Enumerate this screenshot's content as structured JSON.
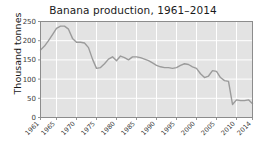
{
  "chart_data": {
    "type": "line",
    "title": "Banana production, 1961–2014",
    "xlabel": "",
    "ylabel": "Thousand tonnes",
    "xlim": [
      1961,
      2014
    ],
    "ylim": [
      0,
      250
    ],
    "grid": true,
    "legend": "none",
    "line_color": "#9b9b9b",
    "plot_bg": "#e3e3e3",
    "grid_color": "#ffffff",
    "xticks": [
      "1961",
      "1965",
      "1970",
      "1975",
      "1980",
      "1985",
      "1990",
      "1995",
      "2000",
      "2005",
      "2010",
      "2014"
    ],
    "xtick_values": [
      1961,
      1965,
      1970,
      1975,
      1980,
      1985,
      1990,
      1995,
      2000,
      2005,
      2010,
      2014
    ],
    "yticks": [
      "0",
      "50",
      "100",
      "150",
      "200",
      "250"
    ],
    "ytick_values": [
      0,
      50,
      100,
      150,
      200,
      250
    ],
    "x": [
      1961,
      1962,
      1963,
      1964,
      1965,
      1966,
      1967,
      1968,
      1969,
      1970,
      1971,
      1972,
      1973,
      1974,
      1975,
      1976,
      1977,
      1978,
      1979,
      1980,
      1981,
      1982,
      1983,
      1984,
      1985,
      1986,
      1987,
      1988,
      1989,
      1990,
      1991,
      1992,
      1993,
      1994,
      1995,
      1996,
      1997,
      1998,
      1999,
      2000,
      2001,
      2002,
      2003,
      2004,
      2005,
      2006,
      2007,
      2008,
      2009,
      2010,
      2011,
      2012,
      2013,
      2014
    ],
    "values": [
      176,
      186,
      200,
      216,
      232,
      238,
      238,
      230,
      206,
      196,
      196,
      194,
      182,
      152,
      128,
      130,
      140,
      152,
      158,
      148,
      160,
      156,
      150,
      158,
      158,
      156,
      152,
      148,
      142,
      136,
      132,
      130,
      130,
      128,
      130,
      136,
      140,
      138,
      132,
      128,
      114,
      104,
      108,
      122,
      120,
      104,
      96,
      94,
      34,
      46,
      44,
      44,
      46,
      36
    ],
    "series": [
      {
        "name": "Banana production",
        "values": [
          176,
          186,
          200,
          216,
          232,
          238,
          238,
          230,
          206,
          196,
          196,
          194,
          182,
          152,
          128,
          130,
          140,
          152,
          158,
          148,
          160,
          156,
          150,
          158,
          158,
          156,
          152,
          148,
          142,
          136,
          132,
          130,
          130,
          128,
          130,
          136,
          140,
          138,
          132,
          128,
          114,
          104,
          108,
          122,
          120,
          104,
          96,
          94,
          34,
          46,
          44,
          44,
          46,
          36
        ]
      }
    ]
  }
}
